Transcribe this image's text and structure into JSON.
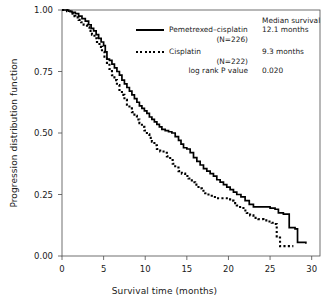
{
  "chart_data": {
    "type": "line",
    "title": "",
    "xlabel": "Survival time (months)",
    "ylabel": "Progression distribution function",
    "xlim": [
      0,
      31
    ],
    "ylim": [
      0,
      1.0
    ],
    "xticks": [
      "0",
      "5",
      "10",
      "15",
      "20",
      "25",
      "30"
    ],
    "xtick_values": [
      0,
      5,
      10,
      15,
      20,
      25,
      30
    ],
    "yticks": [
      "0.00",
      "0.25",
      "0.50",
      "0.75",
      "1.00"
    ],
    "ytick_values": [
      0.0,
      0.25,
      0.5,
      0.75,
      1.0
    ],
    "grid": false,
    "legend_position": "top-right",
    "series": [
      {
        "name": "Pemetrexed–cisplatin",
        "n_label": "(N=226)",
        "style": "solid",
        "median_survival": "12.1 months",
        "points": [
          [
            0.0,
            1.0
          ],
          [
            0.5,
            1.0
          ],
          [
            0.8,
            0.995
          ],
          [
            1.2,
            0.99
          ],
          [
            1.6,
            0.985
          ],
          [
            2.0,
            0.975
          ],
          [
            2.4,
            0.965
          ],
          [
            2.8,
            0.955
          ],
          [
            3.2,
            0.94
          ],
          [
            3.5,
            0.925
          ],
          [
            3.8,
            0.915
          ],
          [
            4.1,
            0.9
          ],
          [
            4.4,
            0.885
          ],
          [
            4.7,
            0.87
          ],
          [
            5.0,
            0.855
          ],
          [
            5.2,
            0.83
          ],
          [
            5.4,
            0.8
          ],
          [
            5.7,
            0.795
          ],
          [
            6.0,
            0.78
          ],
          [
            6.3,
            0.765
          ],
          [
            6.6,
            0.75
          ],
          [
            6.9,
            0.735
          ],
          [
            7.2,
            0.715
          ],
          [
            7.5,
            0.7
          ],
          [
            7.8,
            0.685
          ],
          [
            8.1,
            0.67
          ],
          [
            8.4,
            0.655
          ],
          [
            8.7,
            0.64
          ],
          [
            9.0,
            0.625
          ],
          [
            9.3,
            0.61
          ],
          [
            9.6,
            0.6
          ],
          [
            9.9,
            0.59
          ],
          [
            10.2,
            0.58
          ],
          [
            10.5,
            0.565
          ],
          [
            10.8,
            0.555
          ],
          [
            11.1,
            0.545
          ],
          [
            11.4,
            0.535
          ],
          [
            11.7,
            0.525
          ],
          [
            12.0,
            0.515
          ],
          [
            12.4,
            0.51
          ],
          [
            12.8,
            0.505
          ],
          [
            13.2,
            0.5
          ],
          [
            13.6,
            0.485
          ],
          [
            14.0,
            0.47
          ],
          [
            14.3,
            0.455
          ],
          [
            14.6,
            0.44
          ],
          [
            15.0,
            0.435
          ],
          [
            15.4,
            0.42
          ],
          [
            15.8,
            0.4
          ],
          [
            16.2,
            0.385
          ],
          [
            16.6,
            0.37
          ],
          [
            17.0,
            0.355
          ],
          [
            17.4,
            0.345
          ],
          [
            17.8,
            0.335
          ],
          [
            18.2,
            0.325
          ],
          [
            18.6,
            0.31
          ],
          [
            19.0,
            0.3
          ],
          [
            19.4,
            0.29
          ],
          [
            19.8,
            0.28
          ],
          [
            20.2,
            0.27
          ],
          [
            20.6,
            0.26
          ],
          [
            21.0,
            0.25
          ],
          [
            21.5,
            0.24
          ],
          [
            22.0,
            0.225
          ],
          [
            22.5,
            0.21
          ],
          [
            23.0,
            0.2
          ],
          [
            24.0,
            0.2
          ],
          [
            25.0,
            0.195
          ],
          [
            25.6,
            0.19
          ],
          [
            26.0,
            0.175
          ],
          [
            26.6,
            0.17
          ],
          [
            27.0,
            0.17
          ],
          [
            27.3,
            0.115
          ],
          [
            28.0,
            0.11
          ],
          [
            28.3,
            0.055
          ],
          [
            29.3,
            0.05
          ]
        ]
      },
      {
        "name": "Cisplatin",
        "n_label": "(N=222)",
        "style": "dotted",
        "median_survival": "9.3 months",
        "points": [
          [
            0.0,
            1.0
          ],
          [
            0.6,
            0.995
          ],
          [
            1.0,
            0.985
          ],
          [
            1.3,
            0.975
          ],
          [
            1.6,
            0.97
          ],
          [
            2.0,
            0.96
          ],
          [
            2.3,
            0.95
          ],
          [
            2.6,
            0.94
          ],
          [
            3.0,
            0.93
          ],
          [
            3.3,
            0.915
          ],
          [
            3.6,
            0.9
          ],
          [
            3.9,
            0.885
          ],
          [
            4.2,
            0.87
          ],
          [
            4.5,
            0.85
          ],
          [
            4.8,
            0.83
          ],
          [
            5.1,
            0.81
          ],
          [
            5.4,
            0.785
          ],
          [
            5.7,
            0.76
          ],
          [
            6.0,
            0.735
          ],
          [
            6.3,
            0.715
          ],
          [
            6.6,
            0.695
          ],
          [
            6.9,
            0.675
          ],
          [
            7.2,
            0.655
          ],
          [
            7.5,
            0.635
          ],
          [
            7.8,
            0.615
          ],
          [
            8.1,
            0.6
          ],
          [
            8.4,
            0.585
          ],
          [
            8.7,
            0.57
          ],
          [
            9.0,
            0.555
          ],
          [
            9.3,
            0.54
          ],
          [
            9.6,
            0.525
          ],
          [
            9.9,
            0.51
          ],
          [
            10.2,
            0.495
          ],
          [
            10.5,
            0.48
          ],
          [
            10.8,
            0.465
          ],
          [
            11.1,
            0.45
          ],
          [
            11.4,
            0.435
          ],
          [
            11.8,
            0.425
          ],
          [
            12.2,
            0.42
          ],
          [
            12.6,
            0.405
          ],
          [
            13.0,
            0.39
          ],
          [
            13.3,
            0.375
          ],
          [
            13.6,
            0.36
          ],
          [
            14.0,
            0.345
          ],
          [
            14.4,
            0.335
          ],
          [
            14.8,
            0.325
          ],
          [
            15.2,
            0.315
          ],
          [
            15.6,
            0.3
          ],
          [
            16.0,
            0.29
          ],
          [
            16.4,
            0.275
          ],
          [
            16.8,
            0.265
          ],
          [
            17.2,
            0.255
          ],
          [
            17.6,
            0.245
          ],
          [
            18.0,
            0.24
          ],
          [
            18.6,
            0.235
          ],
          [
            19.2,
            0.235
          ],
          [
            19.8,
            0.23
          ],
          [
            20.2,
            0.225
          ],
          [
            20.6,
            0.215
          ],
          [
            21.0,
            0.205
          ],
          [
            21.4,
            0.195
          ],
          [
            21.8,
            0.185
          ],
          [
            22.2,
            0.175
          ],
          [
            22.6,
            0.165
          ],
          [
            23.0,
            0.155
          ],
          [
            23.6,
            0.15
          ],
          [
            24.2,
            0.145
          ],
          [
            24.8,
            0.14
          ],
          [
            25.2,
            0.135
          ],
          [
            25.5,
            0.13
          ],
          [
            25.8,
            0.075
          ],
          [
            26.2,
            0.04
          ],
          [
            27.0,
            0.04
          ],
          [
            27.8,
            0.04
          ]
        ]
      }
    ],
    "annotations": {
      "median_survival_header": "Median survival",
      "log_rank_label": "log rank P value",
      "log_rank_value": "0.020"
    }
  },
  "legend": {
    "header": "Median survival",
    "rows": [
      {
        "name": "Pemetrexed–cisplatin",
        "n": "(N=226)",
        "value": "12.1 months"
      },
      {
        "name": "Cisplatin",
        "n": "(N=222)",
        "value": "9.3 months"
      }
    ],
    "pvalue_label": "log rank P value",
    "pvalue": "0.020"
  },
  "axes": {
    "x_title": "Survival time (months)",
    "y_title": "Progression distribution function",
    "x_ticks": [
      "0",
      "5",
      "10",
      "15",
      "20",
      "25",
      "30"
    ],
    "y_ticks": [
      "0.00",
      "0.25",
      "0.50",
      "0.75",
      "1.00"
    ]
  },
  "colors": {
    "line": "#000000",
    "axis": "#4d4d4d",
    "text": "#1a1a1a",
    "background": "#ffffff"
  }
}
